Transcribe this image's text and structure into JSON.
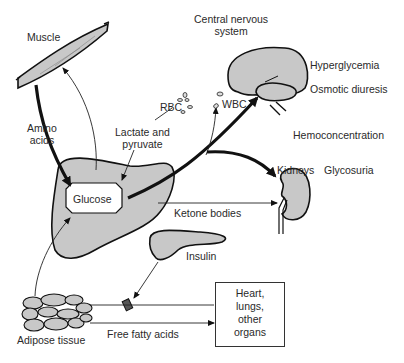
{
  "diagram": {
    "type": "metabolic-flow-diagram",
    "colors": {
      "organ_fill": "#c8c8c8",
      "stroke": "#111111",
      "background": "#ffffff"
    },
    "labels": {
      "muscle": "Muscle",
      "amino_acids_line1": "Amino",
      "amino_acids_line2": "acids",
      "rbc": "RBC",
      "lactate_line1": "Lactate and",
      "lactate_line2": "pyruvate",
      "cns_line1": "Central nervous",
      "cns_line2": "system",
      "wbc": "WBC",
      "hyperglycemia": "Hyperglycemia",
      "osmotic_diuresis": "Osmotic diuresis",
      "hemoconcentration": "Hemoconcentration",
      "kidneys": "Kidneys",
      "glycosuria": "Glycosuria",
      "glucose": "Glucose",
      "ketone_bodies": "Ketone bodies",
      "insulin": "Insulin",
      "adipose_tissue": "Adipose tissue",
      "free_fatty_acids": "Free fatty acids",
      "organs_box": [
        "Heart,",
        "lungs,",
        "other",
        "organs"
      ]
    },
    "nodes": [
      "Muscle",
      "Liver (Glucose)",
      "RBC",
      "WBC",
      "Central nervous system",
      "Kidneys",
      "Pancreas (Insulin)",
      "Adipose tissue",
      "Heart, lungs, other organs"
    ],
    "edges": [
      {
        "from": "Muscle",
        "to": "Glucose",
        "label": "Amino acids",
        "weight": "thick"
      },
      {
        "from": "Glucose",
        "to": "Muscle",
        "weight": "thin"
      },
      {
        "from": "RBC",
        "to": "Glucose",
        "label": "Lactate and pyruvate",
        "weight": "thin"
      },
      {
        "from": "Glucose",
        "to": "Central nervous system",
        "weight": "thick"
      },
      {
        "from": "Glucose",
        "to": "WBC",
        "weight": "thin"
      },
      {
        "from": "Glucose",
        "to": "Kidneys",
        "weight": "thick"
      },
      {
        "from": "Liver",
        "to": "Kidneys",
        "label": "Ketone bodies",
        "weight": "thin"
      },
      {
        "from": "Insulin",
        "to": "Free fatty acids block",
        "weight": "thin"
      },
      {
        "from": "Adipose tissue",
        "to": "Glucose",
        "weight": "thin"
      },
      {
        "from": "Adipose tissue",
        "to": "Heart, lungs, other organs",
        "label": "Free fatty acids",
        "weight": "thin"
      }
    ]
  }
}
